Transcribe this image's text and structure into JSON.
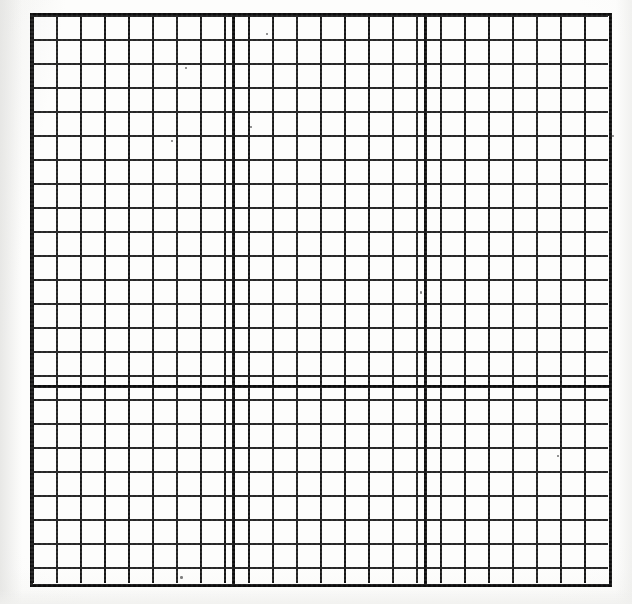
{
  "document": {
    "kind": "graph-paper-scan",
    "title": "Blank graph paper grid",
    "description": "Photocopied sheet of blank square graph paper with heavier major rules",
    "paper_color": "#fdfdfc",
    "ink_color": "#151515",
    "major_ink_color": "#0c0c0c"
  },
  "grid": {
    "left": 32,
    "top": 15,
    "width": 576,
    "height": 568,
    "cell_size": 24,
    "columns": 24,
    "rows": 23,
    "minor_line_width": "1.6px",
    "major_line_width": "3.4px",
    "border_width": "3.2px",
    "major_interval_cells": 8,
    "major_vertical_positions": [
      200,
      392
    ],
    "major_horizontal_positions": [
      370
    ],
    "labels": {
      "none": ""
    }
  },
  "chart_data": {
    "type": "table",
    "xlabel": "",
    "ylabel": "",
    "categories": [],
    "values": [],
    "grid": true,
    "legend_position": "none",
    "axis_ranges": {
      "x": [
        0,
        24
      ],
      "y": [
        0,
        23
      ]
    },
    "cell_size_px": 24,
    "major_gridline_every": 8
  },
  "specks": [
    {
      "left": 185,
      "top": 67,
      "w": 2,
      "h": 2
    },
    {
      "left": 171,
      "top": 140,
      "w": 2,
      "h": 2
    },
    {
      "left": 420,
      "top": 291,
      "w": 2,
      "h": 3
    },
    {
      "left": 266,
      "top": 33,
      "w": 2,
      "h": 2
    },
    {
      "left": 180,
      "top": 576,
      "w": 3,
      "h": 3
    },
    {
      "left": 557,
      "top": 455,
      "w": 2,
      "h": 2
    },
    {
      "left": 250,
      "top": 126,
      "w": 2,
      "h": 2
    },
    {
      "left": 612,
      "top": 135,
      "w": 2,
      "h": 2
    }
  ]
}
